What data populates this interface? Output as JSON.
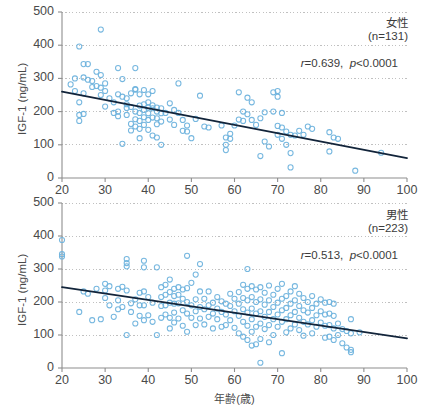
{
  "figure": {
    "axis": {
      "ylabel": "IGF-1 (ng/mL)",
      "xlabel": "年齢(歳)",
      "yticks": [
        "0",
        "100",
        "200",
        "300",
        "400",
        "500"
      ],
      "xticks": [
        "20",
        "30",
        "40",
        "50",
        "60",
        "70",
        "80",
        "90",
        "100"
      ],
      "ylim": [
        0,
        500
      ],
      "xlim": [
        20,
        100
      ]
    },
    "colors": {
      "marker_stroke": "#6fb3dd",
      "regression_line": "#12243a",
      "gridline": "#b9b9b9",
      "axis": "#8e8e8e",
      "text": "#3f3f3f"
    }
  },
  "chart_data": [
    {
      "type": "scatter",
      "id": "female",
      "title": "女性",
      "n_label": "(n=131)",
      "n": 131,
      "stat_r_label": "r=0.639",
      "stat_p_label": "p<0.0001",
      "r": 0.639,
      "p": "<0.0001",
      "xlabel": "年齢(歳)",
      "ylabel": "IGF-1 (ng/mL)",
      "xlim": [
        20,
        100
      ],
      "ylim": [
        0,
        500
      ],
      "xticks": [
        20,
        30,
        40,
        50,
        60,
        70,
        80,
        90,
        100
      ],
      "yticks": [
        0,
        100,
        200,
        300,
        400,
        500
      ],
      "grid": true,
      "legend": "none",
      "regression": {
        "x": [
          20,
          100
        ],
        "y": [
          260,
          60
        ]
      },
      "points": [
        [
          22,
          282
        ],
        [
          23,
          300
        ],
        [
          23,
          262
        ],
        [
          24,
          228
        ],
        [
          24,
          396
        ],
        [
          24,
          172
        ],
        [
          24,
          190
        ],
        [
          25,
          343
        ],
        [
          25,
          255
        ],
        [
          25,
          193
        ],
        [
          25,
          303
        ],
        [
          26,
          343
        ],
        [
          26,
          296
        ],
        [
          27,
          292
        ],
        [
          27,
          274
        ],
        [
          28,
          320
        ],
        [
          28,
          277
        ],
        [
          29,
          447
        ],
        [
          29,
          310
        ],
        [
          29,
          272
        ],
        [
          29,
          250
        ],
        [
          30,
          285
        ],
        [
          30,
          262
        ],
        [
          30,
          215
        ],
        [
          31,
          240
        ],
        [
          32,
          196
        ],
        [
          32,
          228
        ],
        [
          33,
          200
        ],
        [
          33,
          252
        ],
        [
          33,
          331
        ],
        [
          33,
          186
        ],
        [
          34,
          298
        ],
        [
          34,
          103
        ],
        [
          34,
          245
        ],
        [
          35,
          240
        ],
        [
          35,
          222
        ],
        [
          35,
          211
        ],
        [
          35,
          190
        ],
        [
          36,
          255
        ],
        [
          36,
          214
        ],
        [
          36,
          163
        ],
        [
          36,
          143
        ],
        [
          37,
          268
        ],
        [
          37,
          266
        ],
        [
          37,
          200
        ],
        [
          37,
          177
        ],
        [
          37,
          155
        ],
        [
          37,
          331
        ],
        [
          38,
          252
        ],
        [
          38,
          218
        ],
        [
          38,
          196
        ],
        [
          38,
          172
        ],
        [
          38,
          148
        ],
        [
          38,
          120
        ],
        [
          39,
          265
        ],
        [
          39,
          222
        ],
        [
          39,
          205
        ],
        [
          39,
          183
        ],
        [
          39,
          160
        ],
        [
          40,
          252
        ],
        [
          40,
          228
        ],
        [
          40,
          212
        ],
        [
          40,
          195
        ],
        [
          40,
          175
        ],
        [
          40,
          145
        ],
        [
          41,
          262
        ],
        [
          41,
          219
        ],
        [
          41,
          210
        ],
        [
          41,
          182
        ],
        [
          41,
          128
        ],
        [
          42,
          212
        ],
        [
          42,
          200
        ],
        [
          42,
          180
        ],
        [
          42,
          162
        ],
        [
          42,
          122
        ],
        [
          43,
          210
        ],
        [
          43,
          195
        ],
        [
          43,
          170
        ],
        [
          43,
          100
        ],
        [
          44,
          196
        ],
        [
          45,
          225
        ],
        [
          45,
          176
        ],
        [
          46,
          205
        ],
        [
          46,
          160
        ],
        [
          47,
          285
        ],
        [
          47,
          196
        ],
        [
          48,
          142
        ],
        [
          48,
          175
        ],
        [
          49,
          158
        ],
        [
          49,
          140
        ],
        [
          50,
          120
        ],
        [
          51,
          178
        ],
        [
          52,
          248
        ],
        [
          53,
          155
        ],
        [
          54,
          152
        ],
        [
          57,
          158
        ],
        [
          58,
          122
        ],
        [
          58,
          100
        ],
        [
          58,
          84
        ],
        [
          59,
          133
        ],
        [
          59,
          118
        ],
        [
          60,
          158
        ],
        [
          61,
          258
        ],
        [
          61,
          176
        ],
        [
          62,
          200
        ],
        [
          62,
          172
        ],
        [
          63,
          242
        ],
        [
          63,
          192
        ],
        [
          64,
          228
        ],
        [
          64,
          175
        ],
        [
          65,
          160
        ],
        [
          66,
          180
        ],
        [
          66,
          66
        ],
        [
          67,
          198
        ],
        [
          67,
          110
        ],
        [
          68,
          95
        ],
        [
          69,
          258
        ],
        [
          69,
          200
        ],
        [
          70,
          262
        ],
        [
          70,
          245
        ],
        [
          70,
          157
        ],
        [
          70,
          130
        ],
        [
          71,
          196
        ],
        [
          71,
          152
        ],
        [
          71,
          118
        ],
        [
          72,
          140
        ],
        [
          72,
          100
        ],
        [
          73,
          130
        ],
        [
          73,
          75
        ],
        [
          73,
          32
        ],
        [
          74,
          128
        ],
        [
          75,
          142
        ],
        [
          76,
          130
        ],
        [
          77,
          155
        ],
        [
          78,
          148
        ],
        [
          82,
          138
        ],
        [
          82,
          80
        ],
        [
          83,
          122
        ],
        [
          84,
          118
        ],
        [
          88,
          22
        ],
        [
          94,
          76
        ]
      ]
    },
    {
      "type": "scatter",
      "id": "male",
      "title": "男性",
      "n_label": "(n=223)",
      "n": 223,
      "stat_r_label": "r=0.513",
      "stat_p_label": "p<0.0001",
      "r": 0.513,
      "p": "<0.0001",
      "xlabel": "年齢(歳)",
      "ylabel": "IGF-1 (ng/mL)",
      "xlim": [
        20,
        100
      ],
      "ylim": [
        0,
        500
      ],
      "xticks": [
        20,
        30,
        40,
        50,
        60,
        70,
        80,
        90,
        100
      ],
      "yticks": [
        0,
        100,
        200,
        300,
        400,
        500
      ],
      "grid": true,
      "legend": "none",
      "regression": {
        "x": [
          20,
          100
        ],
        "y": [
          245,
          90
        ]
      },
      "points": [
        [
          20,
          388
        ],
        [
          20,
          345
        ],
        [
          20,
          338
        ],
        [
          24,
          170
        ],
        [
          25,
          232
        ],
        [
          26,
          225
        ],
        [
          27,
          145
        ],
        [
          28,
          240
        ],
        [
          29,
          148
        ],
        [
          30,
          255
        ],
        [
          30,
          235
        ],
        [
          30,
          212
        ],
        [
          31,
          248
        ],
        [
          31,
          190
        ],
        [
          32,
          155
        ],
        [
          33,
          240
        ],
        [
          33,
          205
        ],
        [
          33,
          178
        ],
        [
          34,
          246
        ],
        [
          34,
          185
        ],
        [
          35,
          330
        ],
        [
          35,
          318
        ],
        [
          35,
          308
        ],
        [
          35,
          235
        ],
        [
          35,
          100
        ],
        [
          36,
          196
        ],
        [
          36,
          170
        ],
        [
          37,
          208
        ],
        [
          37,
          135
        ],
        [
          38,
          228
        ],
        [
          38,
          190
        ],
        [
          38,
          158
        ],
        [
          39,
          325
        ],
        [
          39,
          305
        ],
        [
          39,
          232
        ],
        [
          39,
          190
        ],
        [
          39,
          145
        ],
        [
          40,
          215
        ],
        [
          40,
          160
        ],
        [
          41,
          198
        ],
        [
          41,
          140
        ],
        [
          42,
          305
        ],
        [
          42,
          100
        ],
        [
          43,
          245
        ],
        [
          43,
          215
        ],
        [
          43,
          188
        ],
        [
          43,
          152
        ],
        [
          44,
          252
        ],
        [
          44,
          222
        ],
        [
          44,
          190
        ],
        [
          44,
          162
        ],
        [
          45,
          268
        ],
        [
          45,
          230
        ],
        [
          45,
          198
        ],
        [
          45,
          152
        ],
        [
          45,
          120
        ],
        [
          46,
          240
        ],
        [
          46,
          218
        ],
        [
          46,
          195
        ],
        [
          46,
          168
        ],
        [
          46,
          138
        ],
        [
          47,
          245
        ],
        [
          47,
          222
        ],
        [
          47,
          196
        ],
        [
          47,
          150
        ],
        [
          48,
          238
        ],
        [
          48,
          210
        ],
        [
          48,
          175
        ],
        [
          48,
          128
        ],
        [
          49,
          340
        ],
        [
          49,
          242
        ],
        [
          49,
          200
        ],
        [
          49,
          165
        ],
        [
          49,
          110
        ],
        [
          50,
          258
        ],
        [
          50,
          190
        ],
        [
          50,
          152
        ],
        [
          51,
          283
        ],
        [
          51,
          208
        ],
        [
          51,
          172
        ],
        [
          51,
          130
        ],
        [
          52,
          315
        ],
        [
          52,
          232
        ],
        [
          52,
          185
        ],
        [
          52,
          150
        ],
        [
          53,
          210
        ],
        [
          53,
          178
        ],
        [
          53,
          132
        ],
        [
          54,
          232
        ],
        [
          54,
          190
        ],
        [
          54,
          155
        ],
        [
          55,
          198
        ],
        [
          55,
          165
        ],
        [
          55,
          120
        ],
        [
          56,
          215
        ],
        [
          56,
          180
        ],
        [
          56,
          148
        ],
        [
          57,
          202
        ],
        [
          57,
          170
        ],
        [
          57,
          125
        ],
        [
          58,
          195
        ],
        [
          58,
          162
        ],
        [
          58,
          130
        ],
        [
          59,
          225
        ],
        [
          59,
          188
        ],
        [
          59,
          145
        ],
        [
          60,
          210
        ],
        [
          60,
          172
        ],
        [
          60,
          122
        ],
        [
          61,
          230
        ],
        [
          61,
          195
        ],
        [
          61,
          158
        ],
        [
          61,
          105
        ],
        [
          62,
          252
        ],
        [
          62,
          212
        ],
        [
          62,
          178
        ],
        [
          62,
          140
        ],
        [
          62,
          95
        ],
        [
          63,
          300
        ],
        [
          63,
          240
        ],
        [
          63,
          205
        ],
        [
          63,
          168
        ],
        [
          63,
          128
        ],
        [
          63,
          85
        ],
        [
          64,
          248
        ],
        [
          64,
          215
        ],
        [
          64,
          180
        ],
        [
          64,
          148
        ],
        [
          64,
          110
        ],
        [
          64,
          68
        ],
        [
          65,
          238
        ],
        [
          65,
          200
        ],
        [
          65,
          165
        ],
        [
          65,
          125
        ],
        [
          65,
          72
        ],
        [
          66,
          245
        ],
        [
          66,
          208
        ],
        [
          66,
          172
        ],
        [
          66,
          135
        ],
        [
          66,
          88
        ],
        [
          66,
          16
        ],
        [
          67,
          228
        ],
        [
          67,
          192
        ],
        [
          67,
          155
        ],
        [
          67,
          118
        ],
        [
          68,
          250
        ],
        [
          68,
          205
        ],
        [
          68,
          170
        ],
        [
          68,
          130
        ],
        [
          68,
          78
        ],
        [
          69,
          222
        ],
        [
          69,
          185
        ],
        [
          69,
          148
        ],
        [
          69,
          100
        ],
        [
          70,
          240
        ],
        [
          70,
          198
        ],
        [
          70,
          162
        ],
        [
          70,
          125
        ],
        [
          71,
          255
        ],
        [
          71,
          210
        ],
        [
          71,
          175
        ],
        [
          71,
          140
        ],
        [
          71,
          45
        ],
        [
          72,
          218
        ],
        [
          72,
          182
        ],
        [
          72,
          148
        ],
        [
          72,
          108
        ],
        [
          73,
          232
        ],
        [
          73,
          195
        ],
        [
          73,
          160
        ],
        [
          73,
          120
        ],
        [
          74,
          248
        ],
        [
          74,
          205
        ],
        [
          74,
          170
        ],
        [
          74,
          132
        ],
        [
          75,
          225
        ],
        [
          75,
          188
        ],
        [
          75,
          152
        ],
        [
          75,
          115
        ],
        [
          76,
          212
        ],
        [
          76,
          175
        ],
        [
          76,
          140
        ],
        [
          76,
          98
        ],
        [
          77,
          200
        ],
        [
          77,
          168
        ],
        [
          77,
          132
        ],
        [
          78,
          218
        ],
        [
          78,
          182
        ],
        [
          78,
          145
        ],
        [
          78,
          105
        ],
        [
          79,
          195
        ],
        [
          79,
          160
        ],
        [
          79,
          125
        ],
        [
          80,
          208
        ],
        [
          80,
          172
        ],
        [
          80,
          138
        ],
        [
          81,
          198
        ],
        [
          81,
          162
        ],
        [
          81,
          128
        ],
        [
          81,
          92
        ],
        [
          82,
          200
        ],
        [
          82,
          165
        ],
        [
          82,
          130
        ],
        [
          82,
          95
        ],
        [
          83,
          195
        ],
        [
          83,
          158
        ],
        [
          83,
          120
        ],
        [
          83,
          85
        ],
        [
          84,
          135
        ],
        [
          84,
          100
        ],
        [
          85,
          118
        ],
        [
          85,
          75
        ],
        [
          86,
          112
        ],
        [
          86,
          62
        ],
        [
          87,
          148
        ],
        [
          87,
          105
        ],
        [
          87,
          55
        ],
        [
          87,
          48
        ],
        [
          89,
          108
        ]
      ]
    }
  ]
}
